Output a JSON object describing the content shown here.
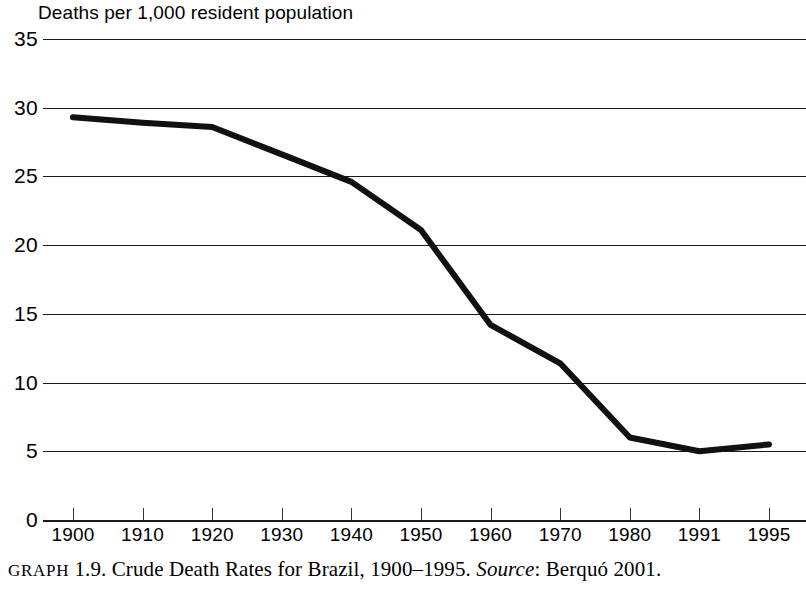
{
  "chart_data": {
    "type": "line",
    "title": "",
    "axis_note": "Deaths per 1,000 resident population",
    "xlabel": "",
    "ylabel": "Deaths per 1,000 resident population",
    "categories": [
      "1900",
      "1910",
      "1920",
      "1930",
      "1940",
      "1950",
      "1960",
      "1970",
      "1980",
      "1991",
      "1995"
    ],
    "x": [
      1900,
      1910,
      1920,
      1930,
      1940,
      1950,
      1960,
      1970,
      1980,
      1991,
      1995
    ],
    "values": [
      29.3,
      28.9,
      28.6,
      26.6,
      24.6,
      21.1,
      14.2,
      11.4,
      6.0,
      5.0,
      5.5
    ],
    "series": [
      {
        "name": "Crude death rate",
        "values": [
          29.3,
          28.9,
          28.6,
          26.6,
          24.6,
          21.1,
          14.2,
          11.4,
          6.0,
          5.0,
          5.5
        ]
      }
    ],
    "ylim": [
      0,
      35
    ],
    "yticks": [
      0,
      5,
      10,
      15,
      20,
      25,
      30,
      35
    ],
    "ytick_labels": [
      "0",
      "5",
      "10",
      "15",
      "20",
      "25",
      "30",
      "35"
    ],
    "grid": "horizontal",
    "legend": "none",
    "line_color": "#111111",
    "line_width": 6
  },
  "caption": {
    "label": "GRAPH",
    "number": "1.9.",
    "text": "Crude Death Rates for Brazil, 1900–1995.",
    "source_label": "Source",
    "source_value": ": Berquó 2001."
  }
}
